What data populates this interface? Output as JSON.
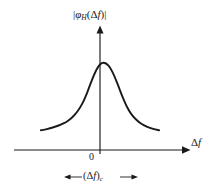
{
  "figure": {
    "title_present": false,
    "background_color": "#ffffff",
    "ink_color": "#1a1a1a",
    "ordinate_label": {
      "left_bar": "|",
      "symbol": "φ",
      "subscript": "H",
      "open_paren": "(",
      "delta": "Δ",
      "variable": "f",
      "close_paren": ")",
      "right_bar": "|",
      "plain": "|φH(Δf)|"
    },
    "abscissa_label": {
      "delta": "Δ",
      "variable": "f",
      "plain": "Δf"
    },
    "origin_label": "0",
    "coherence_label": {
      "open_paren": "(",
      "delta": "Δ",
      "variable": "f",
      "close_paren": ")",
      "subscript": "c",
      "plain": "(Δf)c"
    }
  },
  "chart_data": {
    "type": "line",
    "title": "",
    "xlabel": "Δf",
    "ylabel": "|φH(Δf)|",
    "subtitle": "",
    "annotations": [
      {
        "text": "(Δf)c",
        "kind": "double-headed-arrow-span",
        "axis": "x",
        "x_from": -0.55,
        "x_to": 0.55,
        "meaning": "coherence bandwidth"
      },
      {
        "text": "0",
        "kind": "axis-tick-label",
        "axis": "x",
        "x": 0
      }
    ],
    "grid": false,
    "legend": false,
    "legend_position": "none",
    "axis_arrows": {
      "x_positive": true,
      "y_positive": true
    },
    "xlim": [
      -1.1,
      1.45
    ],
    "ylim": [
      0,
      1.18
    ],
    "xticks": [
      0
    ],
    "xticklabels": [
      "0"
    ],
    "yticks": [],
    "yticklabels": [],
    "series": [
      {
        "name": "|φH(Δf)|",
        "color": "#1a1a1a",
        "x": [
          -1.0,
          -0.9,
          -0.8,
          -0.7,
          -0.62,
          -0.54,
          -0.46,
          -0.38,
          -0.3,
          -0.22,
          -0.14,
          -0.06,
          0.0,
          0.06,
          0.14,
          0.22,
          0.3,
          0.38,
          0.46,
          0.54,
          0.62,
          0.7,
          0.8,
          0.9,
          1.0
        ],
        "y": [
          0.125,
          0.14,
          0.16,
          0.186,
          0.212,
          0.248,
          0.298,
          0.368,
          0.466,
          0.602,
          0.762,
          0.9,
          0.968,
          0.99,
          0.958,
          0.858,
          0.712,
          0.556,
          0.42,
          0.322,
          0.256,
          0.208,
          0.168,
          0.142,
          0.125
        ]
      }
    ]
  },
  "geometry": {
    "x_axis_y_px": 150,
    "y_axis_x_px": 100,
    "peak_y_px": 62,
    "tail_left_x_px": 35,
    "tail_right_x_px": 165,
    "tail_y_px": 140,
    "arrow_span_left_x_px": 66,
    "arrow_span_right_x_px": 136,
    "arrow_span_y_px": 177
  }
}
